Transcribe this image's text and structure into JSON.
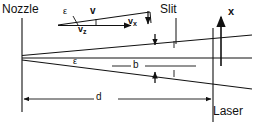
{
  "figure": {
    "type": "schematic-diagram",
    "background_color": "#ffffff",
    "line_color": "#111111"
  },
  "labels": {
    "nozzle": "Nozzle",
    "slit": "Slit",
    "laser": "Laser",
    "axis_x": "x",
    "angle_beam": "ε",
    "angle_vector": "ε",
    "beam_width": "b",
    "distance": "d",
    "velocity": "v",
    "velocity_z_base": "v",
    "velocity_z_sub": "z",
    "velocity_x_base": "v",
    "velocity_x_sub": "x"
  },
  "geometry": {
    "nozzle_vertex": [
      22,
      55
    ],
    "nozzle_line": {
      "x": 22,
      "y_top": 18,
      "y_bottom": 112
    },
    "laser_line": {
      "x": 213,
      "y_top": 28,
      "y_bottom": 122
    },
    "slit_line": {
      "x": 176,
      "y_top": 18,
      "y_bottom": 44
    },
    "axis_arrow": {
      "x": 221,
      "y_tail": 66,
      "y_head": 16
    },
    "beam_upper": [
      [
        22,
        55
      ],
      [
        250,
        35
      ]
    ],
    "beam_center": [
      [
        22,
        58
      ],
      [
        250,
        58
      ]
    ],
    "beam_lower": [
      [
        22,
        60
      ],
      [
        250,
        88
      ]
    ],
    "dimension_d": {
      "y": 99,
      "x_start": 23,
      "x_end": 212
    },
    "arrow_b_top": {
      "x": 155,
      "y_tail": 36,
      "y_head": 48
    },
    "arrow_b_bottom": {
      "x": 155,
      "y_tail": 82,
      "y_head": 70
    },
    "vector_triangle": {
      "origin": [
        60,
        24
      ],
      "v_tip": [
        148,
        12
      ],
      "vz_tip": [
        133,
        24
      ],
      "vx_from": [
        148,
        12
      ],
      "vx_to": [
        148,
        24
      ]
    }
  }
}
